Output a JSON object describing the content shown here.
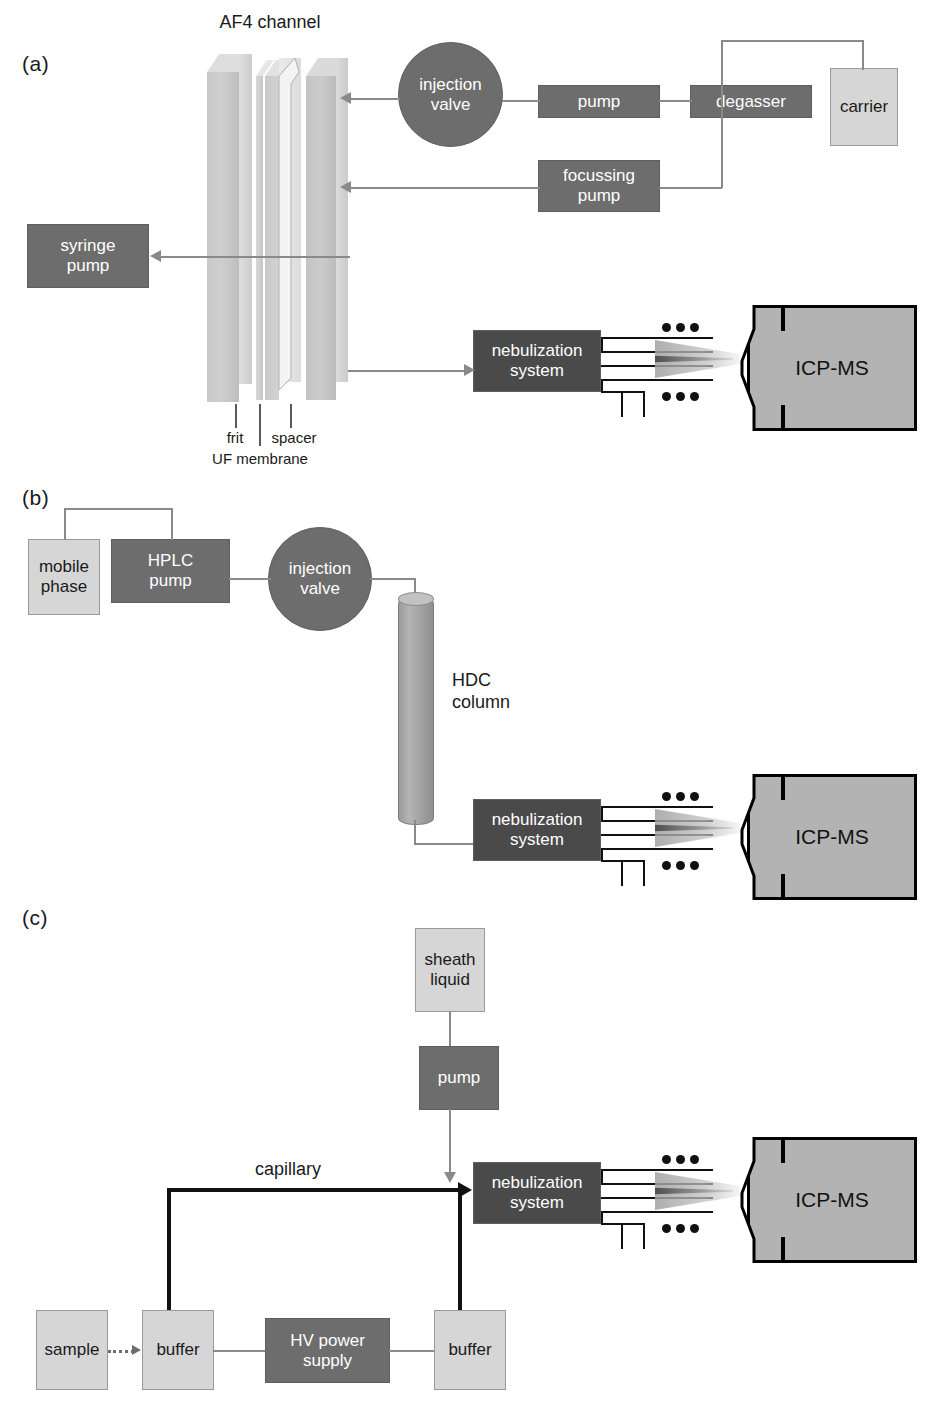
{
  "figure": {
    "type": "schematic-diagram"
  },
  "panels": [
    {
      "id": "a",
      "label": "(a)",
      "title": "AF4 channel",
      "nodes": {
        "injection_valve": "injection\nvalve",
        "pump": "pump",
        "degasser": "degasser",
        "carrier": "carrier",
        "focussing_pump": "focussing\npump",
        "syringe_pump": "syringe\npump",
        "nebulization_system": "nebulization\nsystem",
        "icp_ms": "ICP-MS"
      },
      "channel_labels": {
        "frit": "frit",
        "uf_membrane": "UF membrane",
        "spacer": "spacer"
      }
    },
    {
      "id": "b",
      "label": "(b)",
      "nodes": {
        "mobile_phase": "mobile\nphase",
        "hplc_pump": "HPLC\npump",
        "injection_valve": "injection\nvalve",
        "hdc_column": "HDC\ncolumn",
        "nebulization_system": "nebulization\nsystem",
        "icp_ms": "ICP-MS"
      }
    },
    {
      "id": "c",
      "label": "(c)",
      "nodes": {
        "sheath_liquid": "sheath\nliquid",
        "pump": "pump",
        "capillary": "capillary",
        "nebulization_system": "nebulization\nsystem",
        "icp_ms": "ICP-MS",
        "sample": "sample",
        "buffer_left": "buffer",
        "hv_power_supply": "HV power\nsupply",
        "buffer_right": "buffer"
      }
    }
  ],
  "colors": {
    "dark_box": "#6d6d6d",
    "light_box": "#d6d6d6",
    "icp_fill": "#b3b3b3",
    "plate_fill": "#c9c9c9",
    "connector": "#8a8a8a",
    "capillary": "#111111",
    "text_on_dark": "#ffffff",
    "text_on_light": "#1a1a1a"
  }
}
